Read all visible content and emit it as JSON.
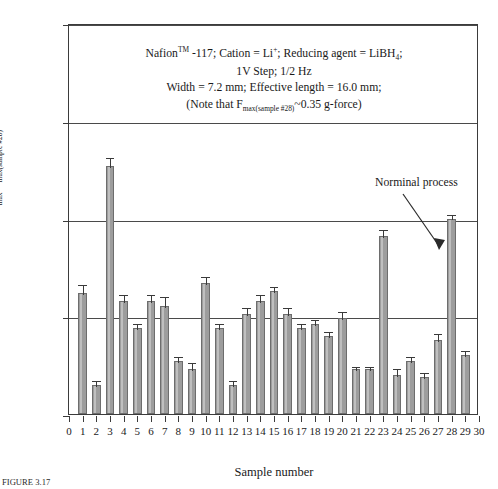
{
  "chart_data": {
    "type": "bar",
    "title": "",
    "xlabel": "Sample number",
    "ylabel": "Fmax/Fmax(sample #28)",
    "ylabel_parts": {
      "main": "F",
      "sub1": "max",
      "slash": "/F",
      "sub2": "max(sample #28)"
    },
    "xlim": [
      0,
      30
    ],
    "ylim": [
      0.0,
      2.0
    ],
    "yticks": [
      "0.0",
      "0.5",
      "1.0",
      "1.5",
      "2.0"
    ],
    "ytick_values": [
      0.0,
      0.5,
      1.0,
      1.5,
      2.0
    ],
    "xticks": [
      "0",
      "1",
      "2",
      "3",
      "4",
      "5",
      "6",
      "7",
      "8",
      "9",
      "10",
      "11",
      "12",
      "13",
      "14",
      "15",
      "16",
      "17",
      "18",
      "19",
      "20",
      "21",
      "22",
      "23",
      "24",
      "25",
      "26",
      "27",
      "28",
      "29",
      "30"
    ],
    "grid": "horizontal gridlines at each y tick",
    "legend": "none",
    "bar_color": "#9d9d9d",
    "bar_edge_color": "#6d6d6d",
    "categories": [
      1,
      2,
      3,
      4,
      5,
      6,
      7,
      8,
      9,
      10,
      11,
      12,
      13,
      14,
      15,
      16,
      17,
      18,
      19,
      20,
      21,
      22,
      23,
      24,
      25,
      26,
      27,
      28,
      29
    ],
    "values": [
      0.62,
      0.15,
      1.27,
      0.58,
      0.44,
      0.58,
      0.55,
      0.27,
      0.23,
      0.67,
      0.44,
      0.15,
      0.51,
      0.58,
      0.63,
      0.51,
      0.44,
      0.46,
      0.4,
      0.49,
      0.23,
      0.23,
      0.91,
      0.2,
      0.27,
      0.19,
      0.38,
      1.0,
      0.3
    ],
    "errors": [
      0.05,
      0.03,
      0.05,
      0.04,
      0.03,
      0.04,
      0.06,
      0.03,
      0.04,
      0.04,
      0.03,
      0.03,
      0.04,
      0.04,
      0.03,
      0.04,
      0.03,
      0.03,
      0.03,
      0.04,
      0.02,
      0.02,
      0.04,
      0.04,
      0.03,
      0.03,
      0.04,
      0.03,
      0.03
    ],
    "annotations": [
      {
        "text": "Norminal process",
        "points_to_sample": 28,
        "style": "arrow"
      }
    ]
  },
  "note": {
    "line1_a": "Nafion",
    "line1_tm": "TM",
    "line1_b": " -117; Cation = Li",
    "line1_sup": "+",
    "line1_c": "; Reducing agent = LiBH",
    "line1_sub": "4",
    "line1_d": ";",
    "line2": "1V Step; 1/2 Hz",
    "line3": "Width = 7.2 mm; Effective length = 16.0 mm;",
    "line4_a": "(Note that F",
    "line4_sub": "max(sample #28)",
    "line4_b": "~0.35 g-force)"
  },
  "callout": {
    "label": "Norminal process"
  },
  "caption": {
    "text": "FIGURE 3.17"
  }
}
